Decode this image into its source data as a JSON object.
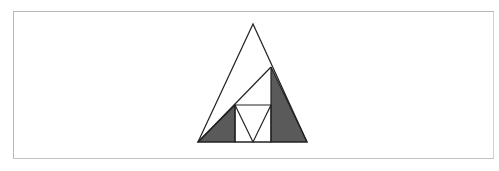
{
  "diagram": {
    "colors": {
      "stroke": "#222222",
      "shade": "#5a5a5a",
      "frame": "#b9b9b9",
      "background": "#ffffff"
    },
    "shapes": {
      "outer_triangle": "198,142 253,24 307,142",
      "shade_left": "198,142 235,105 235,142",
      "shade_right": "271,67 307,142 271,142",
      "square": "235,105 271,105 271,142 235,142",
      "inner_v": "235,105 253,142 271,105",
      "diagonal": "198,142 271,67"
    }
  }
}
